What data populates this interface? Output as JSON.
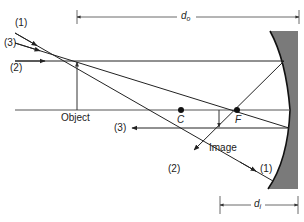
{
  "diagram": {
    "labels": {
      "ray1_in": "(1)",
      "ray3_in": "(3)",
      "ray2_in": "(2)",
      "object": "Object",
      "ray3_out": "(3)",
      "center": "C",
      "focus": "F",
      "image": "Image",
      "ray2_out": "(2)",
      "ray1_out": "(1)",
      "do_main": "d",
      "do_sub": "o",
      "di_main": "d",
      "di_sub": "i"
    },
    "colors": {
      "line": "#222222",
      "axis": "#555555",
      "mirror_fill": "#7a7a7a",
      "mirror_edge": "#111111"
    }
  }
}
